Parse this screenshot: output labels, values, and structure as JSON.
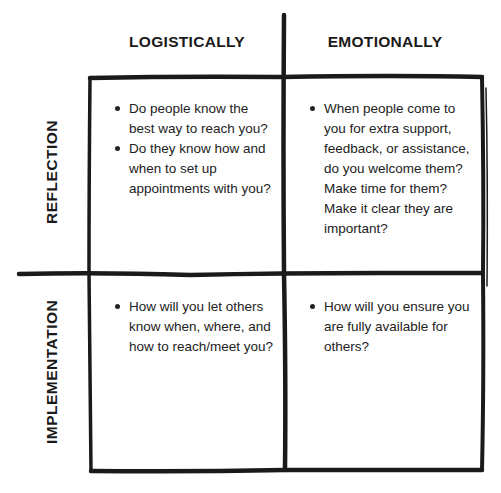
{
  "diagram": {
    "type": "2x2 matrix",
    "columns": [
      {
        "id": "logistically",
        "label": "LOGISTICALLY"
      },
      {
        "id": "emotionally",
        "label": "EMOTIONALLY"
      }
    ],
    "rows": [
      {
        "id": "reflection",
        "label": "REFLECTION"
      },
      {
        "id": "implementation",
        "label": "IMPLEMENTATION"
      }
    ],
    "cells": {
      "reflection_logistically": {
        "bullets": [
          "Do people know the best way to reach you?",
          "Do they know how and when to set up appointments with you?"
        ]
      },
      "reflection_emotionally": {
        "bullets": [
          "When people come to you for extra support, feedback, or assistance, do you welcome them? Make time for them? Make it clear they are important?"
        ]
      },
      "implementation_logistically": {
        "bullets": [
          "How will you let others know when, where, and how to reach/meet you?"
        ]
      },
      "implementation_emotionally": {
        "bullets": [
          "How will you ensure you are fully available for others?"
        ]
      }
    },
    "colors": {
      "ink": "#1a1a1a",
      "background": "#ffffff",
      "text": "#222222"
    }
  }
}
